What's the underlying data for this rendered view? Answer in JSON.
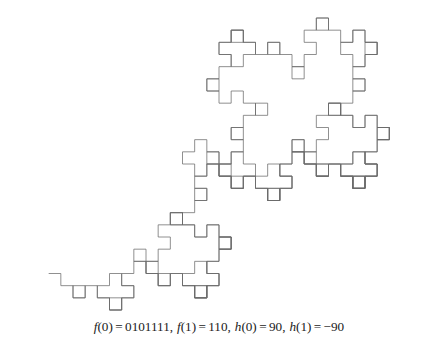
{
  "figure": {
    "background_color": "#ffffff",
    "caption_text": "f(0) = 0101111, f(1) = 110, h(0) = 90, h(1) = -90",
    "caption": {
      "f0_name": "f",
      "f0_arg": "(0)",
      "eq": "=",
      "f0_value": "0101111",
      "comma": ",",
      "f1_name": "f",
      "f1_arg": "(1)",
      "f1_value": "110",
      "h0_name": "h",
      "h0_arg": "(0)",
      "h0_value": "90",
      "h1_name": "h",
      "h1_arg": "(1)",
      "h1_value": "−90"
    }
  },
  "chart_data": {
    "type": "line",
    "title": "",
    "subtitle": "",
    "xlabel": "",
    "ylabel": "",
    "grid": false,
    "legend": null,
    "curve_kind": "l-system-turtle-curve",
    "stroke_color": "#6b6b6b",
    "stroke_width": 0.75,
    "background_color": "#ffffff",
    "axiom": "0",
    "substitution_rules": {
      "0": "0101111",
      "1": "110"
    },
    "turn_angles_degrees": {
      "0": 90,
      "1": -90
    },
    "iterations": 4,
    "initial_heading_degrees": 0,
    "draw_step": 1,
    "bounding_box_px": {
      "x_min": 28,
      "y_min": 18,
      "x_max": 410,
      "y_max": 310
    },
    "viewport_px": {
      "width": 438,
      "height": 313
    }
  }
}
